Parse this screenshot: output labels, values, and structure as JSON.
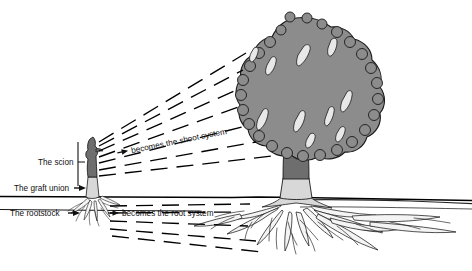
{
  "figure": {
    "background_color": "#ffffff",
    "ground_line_color": "#000000",
    "labels": {
      "scion": "The scion",
      "graft_union": "The graft union",
      "rootstock": "The rootstock",
      "becomes_shoot": "becomes the shoot system",
      "becomes_root": "becomes the root system"
    },
    "colors": {
      "canopy_fill": "#8c8c8c",
      "canopy_outline": "#1a1a1a",
      "canopy_gap_fill": "#e6e6e6",
      "scion_trunk_fill": "#6e6e6e",
      "rootstock_fill": "#d4d4d4",
      "root_fill": "#f2f2f2",
      "root_outline": "#1a1a1a",
      "dash_line": "#000000",
      "text": "#111111"
    },
    "parts": {
      "sapling_label": "young grafted plant",
      "tree_label": "mature grafted tree",
      "canopy_label": "shoot system canopy",
      "roots_label": "root system"
    }
  }
}
